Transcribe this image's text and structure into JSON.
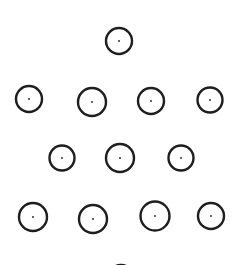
{
  "diagram": {
    "title": "",
    "colors": {
      "stroke": "#1e1e1e",
      "center_dot": "#333333",
      "background": "#ffffff"
    },
    "rows": [
      {
        "row": 1,
        "count": 1
      },
      {
        "row": 2,
        "count": 4
      },
      {
        "row": 3,
        "count": 3
      },
      {
        "row": 4,
        "count": 4
      },
      {
        "row": 5,
        "count": 1,
        "partially_visible": true
      }
    ],
    "total_full_circles": 12
  }
}
